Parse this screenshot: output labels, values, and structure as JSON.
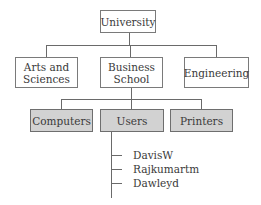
{
  "diagram": {
    "root": {
      "label": "University"
    },
    "level1": [
      {
        "label": "Arts and\nSciences"
      },
      {
        "label": "Business\nSchool"
      },
      {
        "label": "Engineering"
      }
    ],
    "level2": [
      {
        "label": "Computers"
      },
      {
        "label": "Users"
      },
      {
        "label": "Printers"
      }
    ],
    "users_list": [
      {
        "label": "DavisW"
      },
      {
        "label": "Rajkumartm"
      },
      {
        "label": "Dawleyd"
      }
    ],
    "colors": {
      "container_fill": "#d2d2d2",
      "box_fill": "#ffffff",
      "line": "#6a6a6a"
    }
  }
}
